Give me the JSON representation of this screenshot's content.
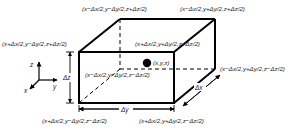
{
  "diagram": {
    "type": "3d-box-control-volume",
    "colors": {
      "line": "#000000",
      "text": "#1a1a1a",
      "background": "#ffffff"
    },
    "center_point": {
      "label": "(x,y,z)"
    },
    "corners": {
      "top_back_left": "(x−Δx/2,y−Δy/2,z+Δz/2)",
      "top_back_right": "(x−Δx/2,y+Δy/2,z+Δz/2)",
      "top_front_left": "(x+Δx/2,y−Δy/2,z+Δz/2)",
      "top_front_right": "(x+Δx/2,y+Δy/2,z+Δz/2)",
      "bottom_back_left": "(x−Δx/2,y−Δy/2,z−Δz/2)",
      "bottom_back_right": "(x−Δx/2,y+Δy/2,z−Δz/2)",
      "bottom_front_left": "(x+Δx/2,y−Δy/2,z−Δz/2)",
      "bottom_front_right": "(x+Δx/2,y+Δy/2,z−Δz/2)"
    },
    "dimensions": {
      "dx": "Δx",
      "dy": "Δy",
      "dz": "Δz"
    },
    "axes": {
      "x": "x",
      "y": "y",
      "z": "z"
    }
  }
}
